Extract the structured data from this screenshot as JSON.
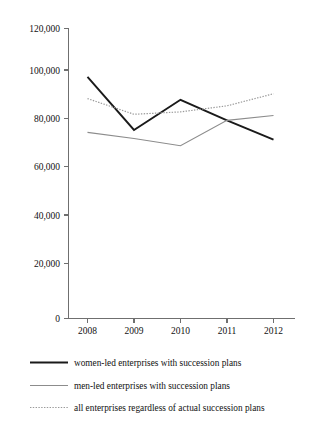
{
  "chart_data": {
    "type": "line",
    "title": "",
    "xlabel": "",
    "ylabel": "",
    "categories": [
      "2008",
      "2009",
      "2010",
      "2011",
      "2012"
    ],
    "x": [
      2008,
      2009,
      2010,
      2011,
      2012
    ],
    "ylim": [
      0,
      120000
    ],
    "yticks": [
      0,
      20000,
      40000,
      60000,
      80000,
      100000,
      120000
    ],
    "ytick_labels": [
      "0",
      "20,000",
      "40,000",
      "60,000",
      "80,000",
      "100,000",
      "120,000"
    ],
    "xtick_labels": [
      "2008",
      "2009",
      "2010",
      "2011",
      "2012"
    ],
    "grid": false,
    "legend_position": "bottom-left",
    "series": [
      {
        "name": "women-led enterprises with succession plans",
        "values": [
          100000,
          78000,
          90500,
          82000,
          74000
        ],
        "color": "#1a1a1a",
        "style": "solid",
        "width": 1.9
      },
      {
        "name": "men-led enterprises with succession plans",
        "values": [
          77000,
          74500,
          71500,
          82000,
          84000
        ],
        "color": "#8c8c8c",
        "style": "solid",
        "width": 1.1
      },
      {
        "name": "all enterprises regardless of actual succession plans",
        "values": [
          91000,
          84500,
          85500,
          88000,
          93000
        ],
        "color": "#9a9a9a",
        "style": "dotted",
        "width": 1.2
      }
    ]
  },
  "legend": {
    "items": [
      {
        "label": "women-led enterprises with succession plans"
      },
      {
        "label": "men-led enterprises with succession plans"
      },
      {
        "label": "all enterprises regardless of actual succession plans"
      }
    ]
  },
  "axes": {
    "y_axis_name": "value-axis",
    "x_axis_name": "year-axis"
  }
}
